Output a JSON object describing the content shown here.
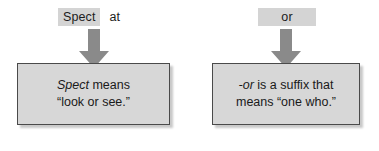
{
  "diagram": {
    "type": "word-parts-definition-diagram",
    "colors": {
      "box_fill": "#d7d7d7",
      "box_border": "#4a4a4a",
      "chip_fill": "#d4d4d4",
      "arrow_fill": "#8a8a8a",
      "text": "#1a1a1a",
      "background": "#ffffff"
    },
    "panels": [
      {
        "id": "spect",
        "word": {
          "highlighted": "Spect",
          "highlighted_style": "chip",
          "remainder": "at",
          "remainder_style": "plain"
        },
        "arrow": {
          "icon": "arrow-down-icon",
          "direction": "down"
        },
        "definition": {
          "lines": [
            {
              "italic": "Spect",
              "regular": " means"
            },
            {
              "italic": "",
              "regular": "“look or see.”"
            }
          ]
        }
      },
      {
        "id": "or",
        "word": {
          "highlighted": "or",
          "highlighted_style": "chip-wide",
          "remainder": "",
          "remainder_style": "plain"
        },
        "arrow": {
          "icon": "arrow-down-icon",
          "direction": "down"
        },
        "definition": {
          "lines": [
            {
              "italic": "-or",
              "regular": " is a suffix that"
            },
            {
              "italic": "",
              "regular": "means “one who.”"
            }
          ]
        }
      }
    ]
  }
}
